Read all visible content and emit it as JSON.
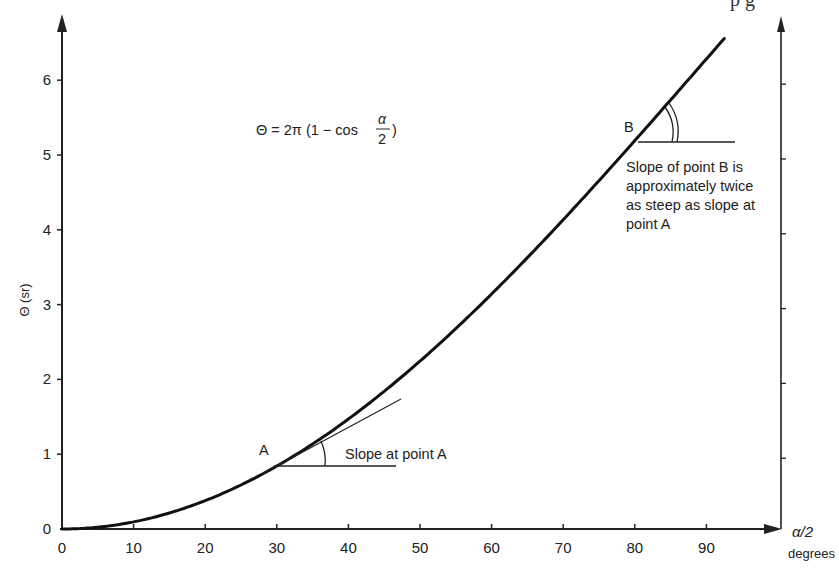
{
  "chart_data": {
    "type": "line",
    "title": "",
    "equation": {
      "lhs": "Θ = 2π (1 − cos",
      "frac_num": "α",
      "frac_den": "2",
      "rhs": ")"
    },
    "xlabel": "α/2",
    "xlabel_units": "degrees",
    "ylabel": "Θ (sr)",
    "xlim": [
      0,
      100
    ],
    "ylim": [
      0,
      6.8
    ],
    "x_ticks": [
      0,
      10,
      20,
      30,
      40,
      50,
      60,
      70,
      80,
      90
    ],
    "x_tick_labels": [
      "0",
      "10",
      "20",
      "30",
      "40",
      "50",
      "60",
      "70",
      "80",
      "90"
    ],
    "y_ticks": [
      0,
      1,
      2,
      3,
      4,
      5,
      6
    ],
    "y_tick_labels": [
      "0",
      "1",
      "2",
      "3",
      "4",
      "5",
      "6"
    ],
    "grid": false,
    "legend": null,
    "series": [
      {
        "name": "Θ = 2π(1 − cos(α/2))",
        "x": [
          0,
          5,
          10,
          15,
          20,
          25,
          30,
          35,
          40,
          45,
          50,
          55,
          60,
          65,
          70,
          75,
          80,
          85,
          90,
          92.7
        ],
        "y": [
          0.0,
          0.024,
          0.095,
          0.214,
          0.379,
          0.589,
          0.842,
          1.136,
          1.47,
          1.84,
          2.244,
          2.679,
          3.142,
          3.628,
          4.134,
          4.657,
          5.192,
          5.735,
          6.283,
          6.579
        ]
      }
    ],
    "annotations": [
      {
        "label": "A",
        "x": 30,
        "y": 0.842,
        "text": "Slope at point A"
      },
      {
        "label": "B",
        "x": 80.4,
        "y": 5.23,
        "text_lines": [
          "Slope of point B is",
          "approximately twice",
          "as steep as slope at",
          "point A"
        ]
      }
    ],
    "secondary_axis": {
      "position": "right",
      "ticks": [
        1,
        2,
        3,
        4,
        5,
        6
      ],
      "labels": []
    }
  },
  "labels": {
    "equation_lhs": "Θ = 2π (1 − cos",
    "equation_num": "α",
    "equation_den": "2",
    "equation_rhs": ")",
    "point_a": "A",
    "point_b": "B",
    "slope_a": "Slope at point A",
    "slope_b_1": "Slope of point B is",
    "slope_b_2": "approximately twice",
    "slope_b_3": "as steep as slope at",
    "slope_b_4": "point A",
    "y_axis_title": "Θ (sr)",
    "x_axis_title": "α/2",
    "x_axis_units": "degrees",
    "header_fragment": "p        g"
  },
  "x_ticks": [
    "0",
    "10",
    "20",
    "30",
    "40",
    "50",
    "60",
    "70",
    "80",
    "90"
  ],
  "y_ticks": [
    "0",
    "1",
    "2",
    "3",
    "4",
    "5",
    "6"
  ]
}
